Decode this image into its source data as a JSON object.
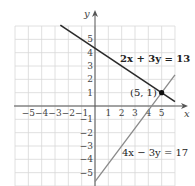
{
  "chart_data": {
    "type": "line",
    "title": "",
    "xlabel": "x",
    "ylabel": "y",
    "xlim": [
      -6,
      6
    ],
    "ylim": [
      -6,
      6
    ],
    "grid": true,
    "x_ticks": [
      "−5",
      "−4",
      "−3",
      "−2",
      "−1",
      "1",
      "2",
      "3",
      "4",
      "5"
    ],
    "x_tick_values": [
      -5,
      -4,
      -3,
      -2,
      -1,
      1,
      2,
      3,
      4,
      5
    ],
    "y_ticks": [
      "5",
      "4",
      "3",
      "2",
      "1",
      "−1",
      "−2",
      "−3",
      "−4",
      "−5"
    ],
    "y_tick_values": [
      5,
      4,
      3,
      2,
      1,
      -1,
      -2,
      -3,
      -4,
      -5
    ],
    "series": [
      {
        "name": "2x + 3y = 13",
        "equation": "2x + 3y = 13",
        "color": "#2a2a2a",
        "x": [
          -2.6,
          6
        ],
        "y": [
          6.07,
          0.33
        ]
      },
      {
        "name": "4x − 3y = 17",
        "equation": "4x − 3y = 17",
        "color": "#8a8a8a",
        "x": [
          0,
          6
        ],
        "y": [
          -5.67,
          2.33
        ]
      }
    ],
    "annotations": [
      {
        "label": "(5, 1)",
        "x": 5,
        "y": 1,
        "type": "intersection-point"
      }
    ]
  },
  "labels": {
    "x_axis": "x",
    "y_axis": "y",
    "line1": "2x + 3y = 13",
    "line2": "4x − 3y = 17",
    "point": "(5, 1)"
  }
}
